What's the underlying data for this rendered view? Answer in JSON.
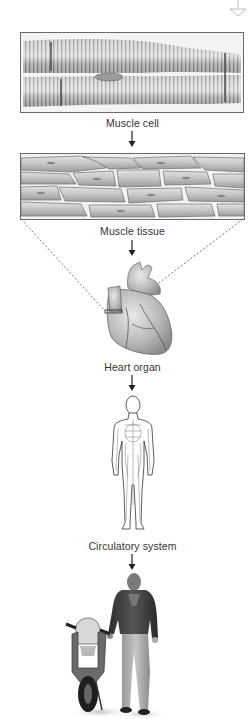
{
  "diagram": {
    "stages": [
      {
        "id": "muscle-cell",
        "label": "Muscle cell"
      },
      {
        "id": "muscle-tissue",
        "label": "Muscle tissue"
      },
      {
        "id": "heart-organ",
        "label": "Heart organ"
      },
      {
        "id": "circulatory-system",
        "label": "Circulatory system"
      },
      {
        "id": "organism",
        "label": ""
      }
    ],
    "colors": {
      "border": "#6a6a6a",
      "text": "#333333",
      "cell_fill": "#c8c8c8",
      "stripe": "#8a8a8a",
      "arrow": "#222222"
    }
  }
}
